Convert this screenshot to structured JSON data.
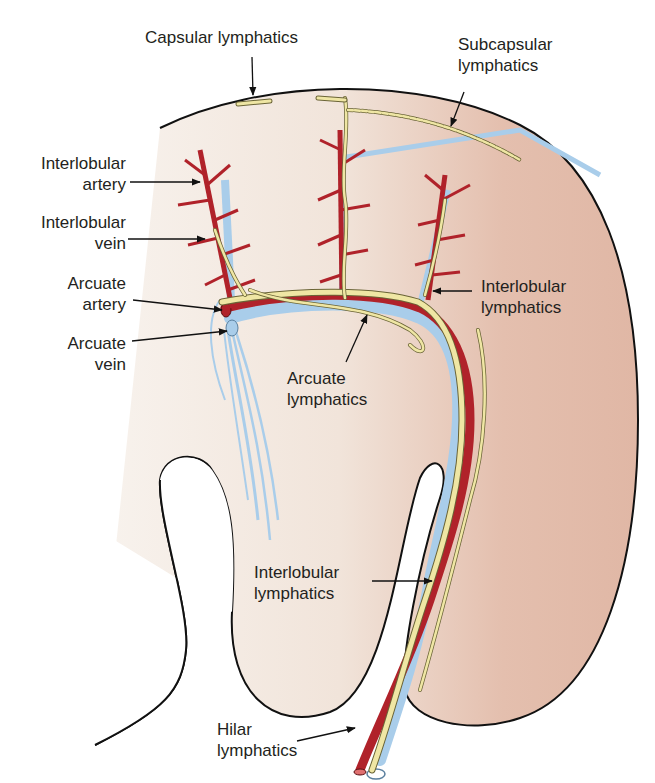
{
  "figure": {
    "colors": {
      "cortex_outer": "#e4bfae",
      "cortex_inner": "#f6f0ea",
      "artery": "#b0222a",
      "artery_outline": "#5a0d10",
      "vein": "#a9cdea",
      "lymphatic": "#efe6a4",
      "lymphatic_outline": "#6a6436",
      "outline": "#111111",
      "text": "#231f20"
    }
  },
  "labels": {
    "capsular_lymphatics": "Capsular lymphatics",
    "subcapsular_lymphatics": "Subcapsular\nlymphatics",
    "interlobular_artery": "Interlobular\nartery",
    "interlobular_vein": "Interlobular\nvein",
    "arcuate_artery": "Arcuate\nartery",
    "arcuate_vein": "Arcuate\nvein",
    "interlobular_lymphatics_upper": "Interlobular\nlymphatics",
    "arcuate_lymphatics": "Arcuate\nlymphatics",
    "interlobular_lymphatics_lower": "Interlobular\nlymphatics",
    "hilar_lymphatics": "Hilar\nlymphatics"
  }
}
